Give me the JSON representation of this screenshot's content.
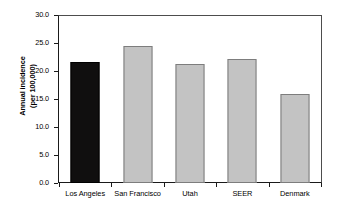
{
  "chart_data": {
    "type": "bar",
    "title": "",
    "xlabel": "",
    "ylabel_line1": "Annual incidence",
    "ylabel_line2": "(per 100,000)",
    "categories": [
      "Los Angeles",
      "San Francisco",
      "Utah",
      "SEER",
      "Denmark"
    ],
    "values": [
      21.8,
      24.7,
      21.3,
      22.2,
      16.0
    ],
    "bar_colors": [
      "#100f0f",
      "#c3c3c3",
      "#c3c3c3",
      "#c3c3c3",
      "#c3c3c3"
    ],
    "bar_border_colors": [
      "#000000",
      "#7d7d7d",
      "#7d7d7d",
      "#7d7d7d",
      "#7d7d7d"
    ],
    "ylim": [
      0.0,
      30.0
    ],
    "ytick_values": [
      30.0,
      25.0,
      20.0,
      15.0,
      10.0,
      5.0,
      0.0
    ],
    "ytick_labels": [
      "30.0",
      "25.0",
      "20.0",
      "15.0",
      "10.0",
      "5.0",
      "0.0"
    ],
    "grid": false,
    "legend": "none",
    "axis_color": "#1a1a1a",
    "background": "#ffffff"
  }
}
